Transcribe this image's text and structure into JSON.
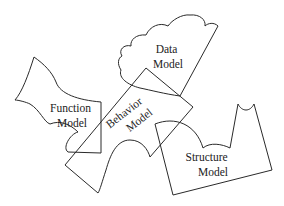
{
  "diagram": {
    "type": "overlapping-shapes",
    "stroke_color": "#2a2a2a",
    "background": "#ffffff",
    "shapes": [
      {
        "id": "function-model",
        "label_line1": "Function",
        "label_line2": "Model"
      },
      {
        "id": "data-model",
        "label_line1": "Data",
        "label_line2": "Model"
      },
      {
        "id": "behavior-model",
        "label_line1": "Behavior",
        "label_line2": "Model"
      },
      {
        "id": "structure-model",
        "label_line1": "Structure",
        "label_line2": "Model"
      }
    ]
  }
}
